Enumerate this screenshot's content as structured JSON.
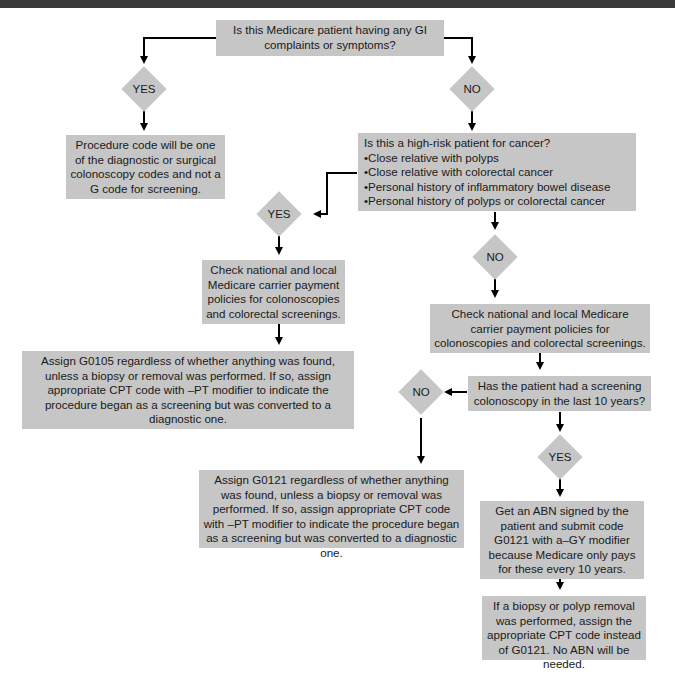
{
  "header_bar": {
    "color": "#3a3a3a"
  },
  "colors": {
    "node_fill": "#c6c6c6",
    "connector": "#000000",
    "background": "#ffffff"
  },
  "nodes": {
    "q_gi": {
      "text": "Is this Medicare patient having any GI complaints or symptoms?"
    },
    "d_gi_yes": {
      "label": "YES"
    },
    "d_gi_no": {
      "label": "NO"
    },
    "r_diagnostic": {
      "text": "Procedure code will be one of the diagnostic or surgical colonoscopy codes and not a G code for screening."
    },
    "q_highrisk": {
      "title": "Is this a high-risk patient for cancer?",
      "bullets": [
        "Close relative with polyps",
        "Close relative with colorectal cancer",
        "Personal history of inflammatory bowel disease",
        "Personal history of polyps or colorectal cancer"
      ]
    },
    "d_hr_yes": {
      "label": "YES"
    },
    "d_hr_no": {
      "label": "NO"
    },
    "check_left": {
      "text": "Check national and local Medicare carrier payment policies for colonoscopies and colorectal screenings."
    },
    "assign_g0105": {
      "text": "Assign G0105 regardless of whether anything was found, unless a biopsy or removal was performed. If so, assign appropriate CPT code with –PT modifier to indicate the procedure began as a screening but was converted to a diagnostic one."
    },
    "check_right": {
      "text": "Check national and local Medicare carrier payment policies for colonoscopies and colorectal screenings."
    },
    "q_10years": {
      "text": "Has the patient had a screening colonoscopy in the last 10 years?"
    },
    "d_10_no": {
      "label": "NO"
    },
    "d_10_yes": {
      "label": "YES"
    },
    "assign_g0121": {
      "text": "Assign G0121 regardless of whether anything was found, unless a biopsy or removal was performed. If so, assign appropriate CPT code with –PT modifier to indicate the procedure began as a screening but was converted to a diagnostic one."
    },
    "abn": {
      "text": "Get an ABN signed by the patient and submit code G0121 with a–GY modifier because Medicare only pays for these every 10 years."
    },
    "biopsy": {
      "text": "If a biopsy or polyp removal was performed, assign the appropriate CPT code instead of G0121. No ABN will be needed."
    }
  }
}
